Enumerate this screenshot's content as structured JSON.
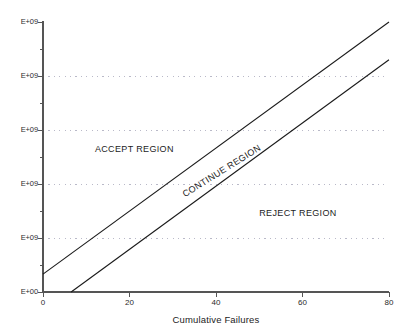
{
  "chart_data": {
    "type": "line",
    "title": "",
    "xlabel": "Cumulative Failures",
    "ylabel": "",
    "xlim": [
      0,
      80
    ],
    "ylim": [
      0,
      5
    ],
    "grid": true,
    "legend": "none",
    "x_ticks": [
      {
        "value": 0,
        "label": "0"
      },
      {
        "value": 20,
        "label": "20"
      },
      {
        "value": 40,
        "label": "40"
      },
      {
        "value": 60,
        "label": "60"
      },
      {
        "value": 80,
        "label": "80"
      }
    ],
    "y_ticks": [
      {
        "value": 0,
        "label": "E+00",
        "gridline": false
      },
      {
        "value": 1,
        "label": "E+09",
        "gridline": true
      },
      {
        "value": 2,
        "label": "E+09",
        "gridline": true
      },
      {
        "value": 3,
        "label": "E+09",
        "gridline": true
      },
      {
        "value": 4,
        "label": "E+09",
        "gridline": true
      },
      {
        "value": 5,
        "label": "E+09",
        "gridline": false
      }
    ],
    "y_minor_ticks": [
      0.5,
      1.5,
      2.5,
      3.5,
      4.5
    ],
    "series": [
      {
        "name": "accept-boundary",
        "points": [
          [
            0,
            0.33
          ],
          [
            80,
            5.0
          ]
        ]
      },
      {
        "name": "reject-boundary",
        "points": [
          [
            6.5,
            0.0
          ],
          [
            80,
            4.3
          ]
        ]
      }
    ],
    "annotations": [
      {
        "name": "accept-region",
        "text": "ACCEPT REGION",
        "x": 12,
        "y": 2.75,
        "rotation": 0
      },
      {
        "name": "continue-region",
        "text": "CONTINUE REGION",
        "x": 33,
        "y": 1.9,
        "rotation": -32
      },
      {
        "name": "reject-region",
        "text": "REJECT REGION",
        "x": 50,
        "y": 1.55,
        "rotation": 0
      }
    ],
    "colors": {
      "axis": "#555555",
      "line": "#1a1a1a",
      "grid": "#b9b9c8",
      "text": "#1c1c1c",
      "background": "#ffffff"
    }
  }
}
